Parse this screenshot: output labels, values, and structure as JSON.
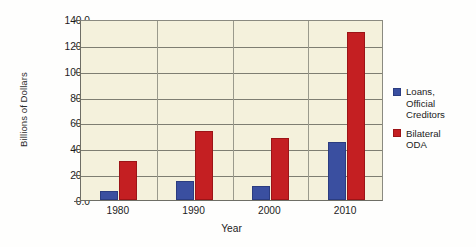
{
  "chart_data": {
    "type": "bar",
    "title": "",
    "subtitle": "",
    "xlabel": "Year",
    "ylabel": "Billions of Dollars",
    "categories": [
      "1980",
      "1990",
      "2000",
      "2010"
    ],
    "series": [
      {
        "name": "Loans,\nOfficial\nCreditors",
        "legend_label": "Loans,\nOfficial\nCreditors",
        "color": "#3a4fa0",
        "values": [
          7.0,
          14.5,
          11.0,
          45.0
        ]
      },
      {
        "name": "Bilateral\nODA",
        "legend_label": "Bilateral\nODA",
        "color": "#c41f22",
        "values": [
          30.5,
          53.5,
          48.0,
          130.0
        ]
      }
    ],
    "ylim": [
      0,
      140
    ],
    "yticks": [
      0,
      20,
      40,
      60,
      80,
      100,
      120,
      140
    ],
    "ytick_labels": [
      "0.0",
      "20.0",
      "40.0",
      "60.0",
      "80.0",
      "100.0",
      "120.0",
      "140.0"
    ],
    "grid": true,
    "grid_axis": "y",
    "legend_position": "right",
    "plot_background": "#f4f1dc",
    "figure_background": "#fefefd"
  },
  "axes": {
    "y_title": "Billions of Dollars",
    "x_title": "Year"
  }
}
